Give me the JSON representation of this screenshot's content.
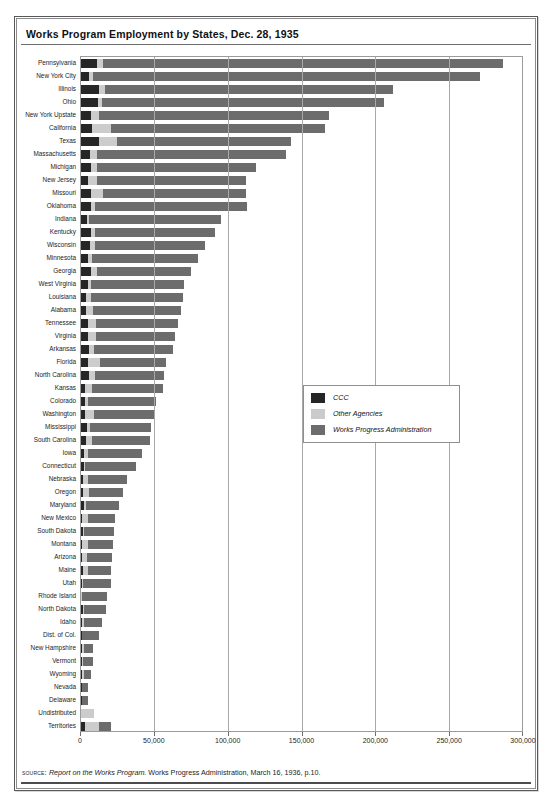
{
  "figure": {
    "title": "Works Program Employment by States, Dec. 28, 1935",
    "source_label": "source:",
    "source_italic": "Report on the Works Program.",
    "source_rest": " Works Progress Administration, March 16, 1936, p.10."
  },
  "legend": {
    "position": "inside-right",
    "items": [
      {
        "label": "CCC",
        "color": "#262626",
        "key": "ccc"
      },
      {
        "label": "Other Agencies",
        "color": "#cbcbcb",
        "key": "other"
      },
      {
        "label": "Works Progress Administration",
        "color": "#6c6c6c",
        "key": "wpa"
      }
    ]
  },
  "chart_data": {
    "type": "bar",
    "orientation": "horizontal",
    "stacked": true,
    "title": "Works Program Employment by States, Dec. 28, 1935",
    "xlabel": "",
    "ylabel": "",
    "xlim": [
      0,
      300000
    ],
    "xticks": [
      0,
      50000,
      100000,
      150000,
      200000,
      250000,
      300000
    ],
    "xticklabels": [
      "0",
      "50,000",
      "100,000",
      "150,000",
      "200,000",
      "250,000",
      "300,000"
    ],
    "grid": "vertical",
    "legend_entries": [
      "CCC",
      "Other Agencies",
      "Works Progress Administration"
    ],
    "categories": [
      "Pennsylvania",
      "New York City",
      "Illinois",
      "Ohio",
      "New York Upstate",
      "California",
      "Texas",
      "Massachusetts",
      "Michigan",
      "New Jersey",
      "Missouri",
      "Oklahoma",
      "Indiana",
      "Kentucky",
      "Wisconsin",
      "Minnesota",
      "Georgia",
      "West Virginia",
      "Louisiana",
      "Alabama",
      "Tennessee",
      "Virginia",
      "Arkansas",
      "Florida",
      "North Carolina",
      "Kansas",
      "Colorado",
      "Washington",
      "Mississippi",
      "South Carolina",
      "Iowa",
      "Connecticut",
      "Nebraska",
      "Oregon",
      "Maryland",
      "New Mexico",
      "South Dakota",
      "Montana",
      "Arizona",
      "Maine",
      "Utah",
      "Rhode Island",
      "North Dakota",
      "Idaho",
      "Dist. of Col.",
      "New Hampshire",
      "Vermont",
      "Wyoming",
      "Nevada",
      "Delaware",
      "Undistributed",
      "Territories"
    ],
    "series": [
      {
        "name": "CCC",
        "color": "#262626",
        "values": [
          11000,
          5500,
          12500,
          11500,
          6500,
          7500,
          12500,
          6000,
          6500,
          4500,
          6500,
          6500,
          4000,
          6500,
          6000,
          5000,
          6500,
          4500,
          3500,
          3500,
          5000,
          4500,
          5500,
          4500,
          5500,
          3000,
          2500,
          3000,
          4000,
          3500,
          2000,
          2000,
          1500,
          1500,
          2000,
          1000,
          1500,
          1000,
          800,
          1500,
          600,
          200,
          1500,
          700,
          600,
          400,
          600,
          500,
          400,
          400,
          0,
          2500
        ]
      },
      {
        "name": "Other Agencies",
        "color": "#cbcbcb",
        "values": [
          4000,
          2500,
          4000,
          2500,
          6000,
          13000,
          12000,
          5000,
          4500,
          6000,
          8500,
          3000,
          1500,
          3000,
          3500,
          2500,
          4500,
          2000,
          3500,
          4500,
          5000,
          5500,
          3000,
          8500,
          4000,
          4500,
          2000,
          5500,
          2000,
          4000,
          2500,
          1000,
          3500,
          4000,
          1500,
          4000,
          800,
          3500,
          3500,
          3500,
          500,
          400,
          700,
          1300,
          300,
          1800,
          600,
          1400,
          500,
          300,
          8500,
          9500
        ]
      },
      {
        "name": "Works Progress Administration",
        "color": "#6c6c6c",
        "values": [
          271000,
          262000,
          194500,
          191500,
          155500,
          144500,
          118000,
          128000,
          107500,
          101000,
          96500,
          103000,
          89500,
          81000,
          74500,
          72000,
          63500,
          63000,
          62000,
          60000,
          55500,
          53500,
          53500,
          44500,
          47000,
          48000,
          46000,
          41000,
          41500,
          39000,
          37000,
          34500,
          26000,
          23000,
          22000,
          18000,
          20000,
          17500,
          16500,
          15500,
          19500,
          17000,
          14500,
          12500,
          11000,
          6000,
          7000,
          5000,
          4000,
          3800,
          0,
          8500
        ]
      }
    ],
    "totals": [
      286000,
      270000,
      211000,
      205500,
      168000,
      165000,
      142500,
      139000,
      118500,
      111500,
      111500,
      112500,
      95000,
      90500,
      84000,
      79500,
      74500,
      69500,
      69000,
      68000,
      65500,
      63500,
      62000,
      57500,
      56500,
      55500,
      50500,
      49500,
      47500,
      46500,
      41500,
      37500,
      31000,
      28500,
      25500,
      23000,
      22300,
      22000,
      20800,
      20500,
      20600,
      17600,
      16700,
      14500,
      11900,
      8200,
      8200,
      6900,
      4900,
      4500,
      8500,
      20500
    ]
  }
}
